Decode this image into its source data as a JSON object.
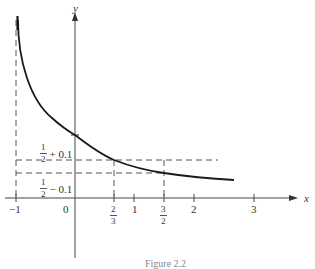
{
  "figure": {
    "caption": "Figure 2.2",
    "axes": {
      "x_label": "x",
      "y_label": "y",
      "origin_label": "0"
    },
    "x_ticks": [
      {
        "label": "−1",
        "value": -1
      },
      {
        "label": "2/3",
        "num": "2",
        "den": "3",
        "value": 0.6667
      },
      {
        "label": "1",
        "value": 1
      },
      {
        "label": "3/2",
        "num": "3",
        "den": "2",
        "value": 1.5
      },
      {
        "label": "2",
        "value": 2
      },
      {
        "label": "3",
        "value": 3
      }
    ],
    "y_levels": [
      {
        "label": "1/2 + 0.1",
        "num": "1",
        "den": "2",
        "suffix": "+ 0.1",
        "value": 0.6
      },
      {
        "label": "1/2 − 0.1",
        "num": "1",
        "den": "2",
        "suffix": "− 0.1",
        "value": 0.4
      }
    ],
    "curve": {
      "description": "y = 1/(1+x)",
      "domain": [
        -0.97,
        2.6
      ],
      "passes_through": [
        [
          0,
          1
        ],
        [
          0.6667,
          0.6
        ],
        [
          1.5,
          0.4
        ]
      ]
    },
    "asymptote": {
      "x": -1,
      "style": "dashed"
    },
    "colors": {
      "curve": "#1a1a1a",
      "axes": "#444444",
      "dashed": "#555555"
    }
  }
}
